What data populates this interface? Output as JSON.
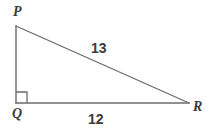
{
  "figure": {
    "background_color": "#ffffff",
    "stroke_color": "#6b6b6b",
    "text_color": "#3b3b3b"
  },
  "vertices": {
    "p": {
      "label": "P",
      "x": 16,
      "y": 26
    },
    "q": {
      "label": "Q",
      "x": 16,
      "y": 103
    },
    "r": {
      "label": "R",
      "x": 189,
      "y": 103
    }
  },
  "markers": {
    "right_angle": {
      "name": "right-angle-marker",
      "at_vertex": "Q",
      "size": 11
    }
  },
  "sides": {
    "hypotenuse": {
      "name": "PR",
      "label": "13",
      "from": "P",
      "to": "R"
    },
    "base": {
      "name": "QR",
      "label": "12",
      "from": "Q",
      "to": "R"
    },
    "vertical": {
      "name": "PQ",
      "label": "",
      "from": "P",
      "to": "Q"
    }
  }
}
